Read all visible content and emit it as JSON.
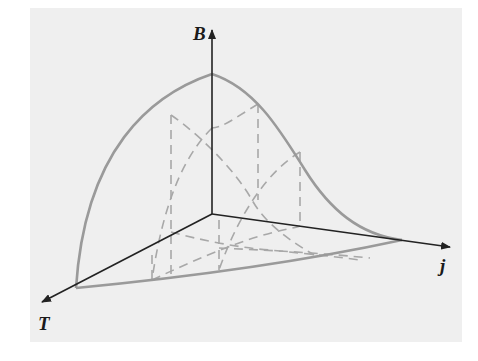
{
  "figure": {
    "axes": {
      "vertical": {
        "label": "B"
      },
      "left": {
        "label": "T"
      },
      "right": {
        "label": "j"
      }
    },
    "colors": {
      "background": "#efefef",
      "axis": "#222222",
      "surface_edge": "#9a9a9a",
      "dashed": "#a8a8a8"
    }
  }
}
